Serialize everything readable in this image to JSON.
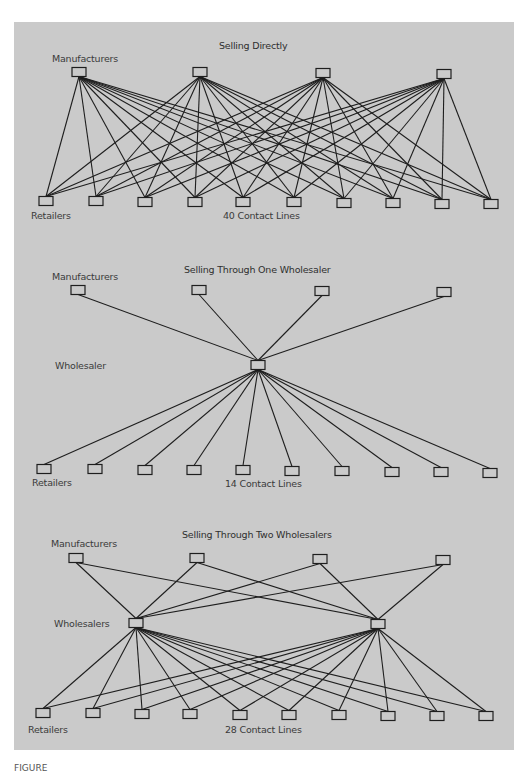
{
  "figure": {
    "panel_color": "#cacaca",
    "line_color": "#1e1e1e",
    "box_fill": "#cacaca",
    "caption_fragment": "FIGURE"
  },
  "sections": [
    {
      "id": "direct",
      "title": "Selling Directly",
      "labels": {
        "manufacturers": "Manufacturers",
        "retailers": "Retailers",
        "contact_lines": "40 Contact Lines"
      },
      "manufacturers": [
        [
          79,
          72
        ],
        [
          200,
          72
        ],
        [
          323,
          73
        ],
        [
          444,
          74
        ]
      ],
      "wholesalers": [],
      "retailers": [
        [
          46,
          201
        ],
        [
          96,
          201
        ],
        [
          145,
          202
        ],
        [
          195,
          202
        ],
        [
          243,
          202
        ],
        [
          294,
          202
        ],
        [
          344,
          203
        ],
        [
          393,
          203
        ],
        [
          442,
          204
        ],
        [
          491,
          204
        ]
      ],
      "mode": "direct"
    },
    {
      "id": "one-wholesaler",
      "title": "Selling Through One Wholesaler",
      "wholesaler_label": "Wholesaler",
      "labels": {
        "manufacturers": "Manufacturers",
        "retailers": "Retailers",
        "contact_lines": "14 Contact Lines"
      },
      "manufacturers": [
        [
          78,
          290
        ],
        [
          199,
          290
        ],
        [
          322,
          291
        ],
        [
          444,
          292
        ]
      ],
      "wholesalers": [
        [
          258,
          365
        ]
      ],
      "retailers": [
        [
          44,
          469
        ],
        [
          95,
          469
        ],
        [
          145,
          470
        ],
        [
          194,
          470
        ],
        [
          243,
          470
        ],
        [
          292,
          471
        ],
        [
          342,
          471
        ],
        [
          392,
          472
        ],
        [
          441,
          472
        ],
        [
          490,
          473
        ]
      ],
      "mode": "wholesale"
    },
    {
      "id": "two-wholesalers",
      "title": "Selling Through Two Wholesalers",
      "wholesaler_label": "Wholesalers",
      "labels": {
        "manufacturers": "Manufacturers",
        "retailers": "Retailers",
        "contact_lines": "28 Contact Lines"
      },
      "manufacturers": [
        [
          76,
          558
        ],
        [
          197,
          558
        ],
        [
          320,
          559
        ],
        [
          443,
          560
        ]
      ],
      "wholesalers": [
        [
          136,
          623
        ],
        [
          378,
          624
        ]
      ],
      "retailers": [
        [
          43,
          713
        ],
        [
          93,
          713
        ],
        [
          142,
          714
        ],
        [
          190,
          714
        ],
        [
          240,
          715
        ],
        [
          289,
          715
        ],
        [
          339,
          715
        ],
        [
          388,
          716
        ],
        [
          437,
          716
        ],
        [
          486,
          716
        ]
      ],
      "mode": "wholesale"
    }
  ]
}
